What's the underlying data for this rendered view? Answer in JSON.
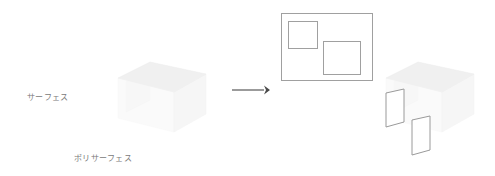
{
  "canvas": {
    "width": 495,
    "height": 176,
    "background": "#ffffff"
  },
  "labels": {
    "surface": "サーフェス",
    "polysurface": "ポリサーフェス"
  },
  "colors": {
    "text": "#7a7a7a",
    "outline": "#9a9a9a",
    "rect_outline": "#a0a0a0",
    "arrow": "#4a4a4a",
    "ghost_fill": "#f0f0f0",
    "background": "#ffffff"
  },
  "arrow": {
    "name": "transform-arrow",
    "direction": "right",
    "x_start": 232,
    "x_end": 268,
    "y": 90
  },
  "left_shape": {
    "name": "surface-open-box",
    "description": "faint isometric open box representing a single surface",
    "top_face": "118,78 150,62 206,74 174,92",
    "left_face": "118,78 174,92 174,132 118,118",
    "right_face": "174,92 206,74 206,114 174,132",
    "inner_face": "126,82 150,68 150,100 126,112"
  },
  "right_shape": {
    "name": "polysurface-exploded-box",
    "description": "faint isometric open box with two detached outlined panels",
    "top_face": "386,78 418,62 474,74 442,92",
    "left_face": "386,78 442,92 442,132 386,118",
    "right_face": "442,92 474,74 474,114 442,132",
    "inner_face": "394,82 418,68 418,100 394,112",
    "panels": [
      {
        "name": "detached-panel-1",
        "points": "386,93 404,89 404,122 386,127"
      },
      {
        "name": "detached-panel-2",
        "points": "412,120 430,116 430,150 412,155"
      }
    ]
  },
  "diagram_rectangle": {
    "name": "surface-boundary-rectangle",
    "outer": {
      "x": 281,
      "y": 13,
      "width": 91,
      "height": 67
    },
    "inner_squares": [
      {
        "name": "inner-square-1",
        "x": 288,
        "y": 21,
        "width": 29,
        "height": 27
      },
      {
        "name": "inner-square-2",
        "x": 323,
        "y": 41,
        "width": 37,
        "height": 33
      }
    ]
  }
}
